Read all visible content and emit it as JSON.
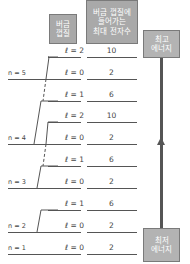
{
  "headers": {
    "subshell": [
      "버금",
      "껍질"
    ],
    "max_electrons": [
      "버금 껍질에",
      "들어가는",
      "최대 전자수"
    ]
  },
  "energy_labels": {
    "highest": [
      "최고",
      "에너지"
    ],
    "lowest": [
      "최저",
      "에너지"
    ]
  },
  "rows": [
    {
      "l": "ℓ = 2",
      "max": "10"
    },
    {
      "l": "ℓ = 0",
      "max": "2"
    },
    {
      "l": "ℓ = 1",
      "max": "6"
    },
    {
      "l": "ℓ = 2",
      "max": "10"
    },
    {
      "l": "ℓ = 0",
      "max": "2"
    },
    {
      "l": "ℓ = 1",
      "max": "6"
    },
    {
      "l": "ℓ = 0",
      "max": "2"
    },
    {
      "l": "ℓ = 1",
      "max": "6"
    },
    {
      "l": "ℓ = 0",
      "max": "2"
    },
    {
      "l": "ℓ = 0",
      "max": "2"
    }
  ],
  "shells": [
    {
      "label": "n = 5"
    },
    {
      "label": "n = 4"
    },
    {
      "label": "n = 3"
    },
    {
      "label": "n = 2"
    },
    {
      "label": "n = 1"
    }
  ]
}
